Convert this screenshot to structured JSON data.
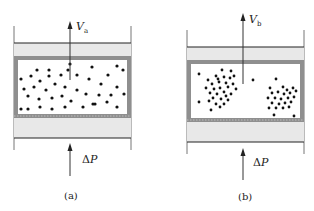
{
  "panels": [
    {
      "id": "a",
      "caption": "(a)",
      "velocity_symbol": "V",
      "velocity_subscript": "a",
      "pressure_label_delta": "Δ",
      "pressure_label_var": "P",
      "particle_distribution": "uniform"
    },
    {
      "id": "b",
      "caption": "(b)",
      "velocity_symbol": "V",
      "velocity_subscript": "b",
      "pressure_label_delta": "Δ",
      "pressure_label_var": "P",
      "particle_distribution": "clustered"
    }
  ],
  "colors": {
    "wall": "#555555",
    "plate_band": "#e6e6e6",
    "frame": "#8c8c8c",
    "particle": "#111111",
    "arrow": "#333333"
  }
}
